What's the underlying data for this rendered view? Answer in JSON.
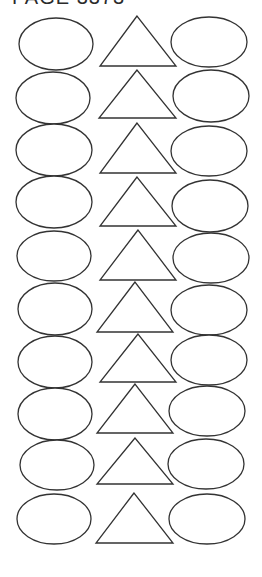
{
  "header": {
    "text": "PAGE 3373"
  },
  "style": {
    "stroke": "#333333",
    "fill": "#ffffff"
  },
  "rows": [
    {
      "left": {
        "cx": 56,
        "cy": 44,
        "rx": 37,
        "ry": 26
      },
      "tri": [
        [
          137,
          16
        ],
        [
          100,
          66
        ],
        [
          176,
          66
        ]
      ],
      "right": {
        "cx": 209,
        "cy": 42,
        "rx": 38,
        "ry": 25
      }
    },
    {
      "left": {
        "cx": 53,
        "cy": 98,
        "rx": 37,
        "ry": 26
      },
      "tri": [
        [
          137,
          70
        ],
        [
          99,
          118
        ],
        [
          176,
          118
        ]
      ],
      "right": {
        "cx": 211,
        "cy": 96,
        "rx": 38,
        "ry": 26
      }
    },
    {
      "left": {
        "cx": 54,
        "cy": 150,
        "rx": 38,
        "ry": 26
      },
      "tri": [
        [
          137,
          123
        ],
        [
          100,
          173
        ],
        [
          176,
          173
        ]
      ],
      "right": {
        "cx": 209,
        "cy": 151,
        "rx": 38,
        "ry": 25
      }
    },
    {
      "left": {
        "cx": 54,
        "cy": 202,
        "rx": 38,
        "ry": 26
      },
      "tri": [
        [
          137,
          177
        ],
        [
          100,
          226
        ],
        [
          176,
          226
        ]
      ],
      "right": {
        "cx": 210,
        "cy": 206,
        "rx": 38,
        "ry": 26
      }
    },
    {
      "left": {
        "cx": 54,
        "cy": 256,
        "rx": 37,
        "ry": 25
      },
      "tri": [
        [
          138,
          230
        ],
        [
          100,
          280
        ],
        [
          176,
          280
        ]
      ],
      "right": {
        "cx": 211,
        "cy": 258,
        "rx": 38,
        "ry": 25
      }
    },
    {
      "left": {
        "cx": 55,
        "cy": 309,
        "rx": 37,
        "ry": 26
      },
      "tri": [
        [
          135,
          282
        ],
        [
          97,
          332
        ],
        [
          173,
          332
        ]
      ],
      "right": {
        "cx": 209,
        "cy": 310,
        "rx": 38,
        "ry": 25
      }
    },
    {
      "left": {
        "cx": 55,
        "cy": 362,
        "rx": 37,
        "ry": 26
      },
      "tri": [
        [
          138,
          334
        ],
        [
          100,
          382
        ],
        [
          176,
          382
        ]
      ],
      "right": {
        "cx": 209,
        "cy": 360,
        "rx": 38,
        "ry": 25
      }
    },
    {
      "left": {
        "cx": 55,
        "cy": 414,
        "rx": 37,
        "ry": 26
      },
      "tri": [
        [
          135,
          384
        ],
        [
          97,
          433
        ],
        [
          173,
          433
        ]
      ],
      "right": {
        "cx": 207,
        "cy": 411,
        "rx": 38,
        "ry": 25
      }
    },
    {
      "left": {
        "cx": 57,
        "cy": 465,
        "rx": 37,
        "ry": 25
      },
      "tri": [
        [
          135,
          438
        ],
        [
          97,
          484
        ],
        [
          173,
          484
        ]
      ],
      "right": {
        "cx": 206,
        "cy": 464,
        "rx": 38,
        "ry": 25
      }
    },
    {
      "left": {
        "cx": 54,
        "cy": 519,
        "rx": 37,
        "ry": 25
      },
      "tri": [
        [
          134,
          493
        ],
        [
          96,
          543
        ],
        [
          173,
          543
        ]
      ],
      "right": {
        "cx": 207,
        "cy": 519,
        "rx": 38,
        "ry": 25
      }
    }
  ]
}
